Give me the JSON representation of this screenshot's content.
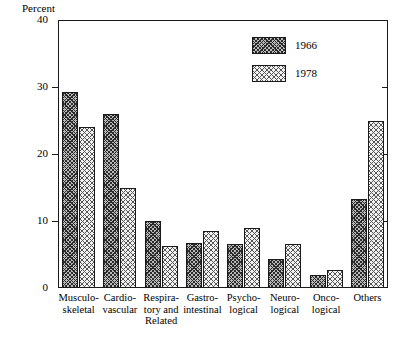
{
  "chart_data": {
    "type": "bar",
    "title": "",
    "xlabel": "",
    "ylabel": "Percent",
    "ylim": [
      0,
      40
    ],
    "yticks": [
      0,
      10,
      20,
      30,
      40
    ],
    "grid": false,
    "legend_position": "top-right-inside",
    "categories": [
      "Musculo-skeletal",
      "Cardio-vascular",
      "Respiratory and Related",
      "Gastro-intestinal",
      "Psycho-logical",
      "Neuro-logical",
      "Onco-logical",
      "Others"
    ],
    "category_lines": [
      [
        "Musculo-",
        "skeletal"
      ],
      [
        "Cardio-",
        "vascular"
      ],
      [
        "Respira-",
        "tory and",
        "Related"
      ],
      [
        "Gastro-",
        "intestinal"
      ],
      [
        "Psycho-",
        "logical"
      ],
      [
        "Neuro-",
        "logical"
      ],
      [
        "Onco-",
        "logical"
      ],
      [
        "Others"
      ]
    ],
    "series": [
      {
        "name": "1966",
        "values": [
          29.2,
          25.9,
          10.0,
          6.7,
          6.5,
          4.3,
          2.0,
          13.3
        ]
      },
      {
        "name": "1978",
        "values": [
          24.0,
          15.0,
          6.2,
          8.5,
          9.0,
          6.6,
          2.7,
          25.0
        ]
      }
    ]
  },
  "axis": {
    "y_title": "Percent",
    "tick_labels": [
      "40",
      "30",
      "20",
      "10",
      "0"
    ]
  },
  "legend": {
    "entries": [
      {
        "label": "1966"
      },
      {
        "label": "1978"
      }
    ]
  },
  "colors": {
    "series_1966": "#b9b9b9",
    "series_1978": "#f2f2f2",
    "outline": "#1a1a1a",
    "background": "#ffffff"
  }
}
